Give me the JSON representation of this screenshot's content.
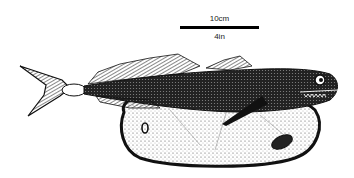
{
  "figure": {
    "scale_bar": {
      "metric_label": "10cm",
      "imperial_label": "4in"
    },
    "colors": {
      "ink": "#111111",
      "background": "#ffffff",
      "shading": "#555555"
    }
  }
}
